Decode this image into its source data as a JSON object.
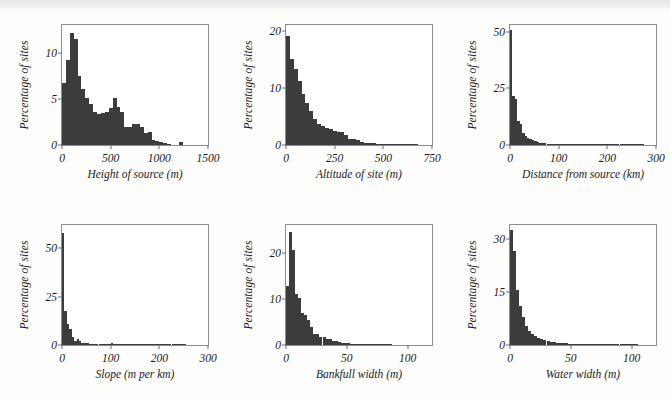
{
  "figure": {
    "background_color": "#fdfdfc",
    "bar_color": "#3c3c3c",
    "axis_color": "#8d8d8d",
    "shared_ylabel": "Percentage of sites"
  },
  "chart_data": [
    {
      "type": "bar",
      "id": "height-of-source",
      "title": "",
      "xlabel": "Height of source (m)",
      "ylabel": "Percentage of sites",
      "xlim": [
        0,
        1500
      ],
      "ylim": [
        0,
        13
      ],
      "xticks": [
        0,
        500,
        1000,
        1500
      ],
      "xtick_labels": [
        "0",
        "500",
        "1000",
        "1500"
      ],
      "yticks": [
        0,
        5,
        10
      ],
      "ytick_labels": [
        "0",
        "5",
        "10"
      ],
      "grid": false,
      "legend": "none",
      "bin_width": 40,
      "bin_starts": [
        0,
        40,
        80,
        120,
        160,
        200,
        240,
        280,
        320,
        360,
        400,
        440,
        480,
        520,
        560,
        600,
        640,
        680,
        720,
        760,
        800,
        840,
        880,
        920,
        960,
        1000,
        1040,
        1080,
        1120,
        1160,
        1200,
        1240
      ],
      "values": [
        6.7,
        9.2,
        12.1,
        11.5,
        7.5,
        6.1,
        5.1,
        4.4,
        3.6,
        3.4,
        3.5,
        3.6,
        4.0,
        5.1,
        4.1,
        3.6,
        2.0,
        2.0,
        2.3,
        2.3,
        1.9,
        1.3,
        1.4,
        0.55,
        0.45,
        0.3,
        0.2,
        0.05,
        0.0,
        0.0,
        0.35,
        0.0
      ]
    },
    {
      "type": "bar",
      "id": "altitude-of-site",
      "title": "",
      "xlabel": "Altitude of site (m)",
      "ylabel": "Percentage of sites",
      "xlim": [
        0,
        750
      ],
      "ylim": [
        0,
        21
      ],
      "xticks": [
        0,
        250,
        500,
        750
      ],
      "xtick_labels": [
        "0",
        "250",
        "500",
        "750"
      ],
      "yticks": [
        0,
        10,
        20
      ],
      "ytick_labels": [
        "0",
        "10",
        "20"
      ],
      "grid": false,
      "legend": "none",
      "bin_width": 20,
      "bin_starts": [
        0,
        20,
        40,
        60,
        80,
        100,
        120,
        140,
        160,
        180,
        200,
        220,
        240,
        260,
        280,
        300,
        320,
        340,
        360,
        380,
        400,
        420,
        440,
        460,
        480,
        500,
        520,
        540,
        560,
        580,
        600,
        620,
        640,
        660,
        680,
        700,
        720
      ],
      "values": [
        19.0,
        15.0,
        13.3,
        11.2,
        9.0,
        7.4,
        6.0,
        4.6,
        3.7,
        3.4,
        2.9,
        2.8,
        2.4,
        2.3,
        2.2,
        1.7,
        1.1,
        1.0,
        0.9,
        0.6,
        0.4,
        0.35,
        0.3,
        0.25,
        0.2,
        0.2,
        0.15,
        0.12,
        0.1,
        0.1,
        0.1,
        0.08,
        0.08,
        0.05,
        0.0,
        0.0,
        0.0
      ]
    },
    {
      "type": "bar",
      "id": "distance-from-source",
      "title": "",
      "xlabel": "Distance from source (km)",
      "ylabel": "Percentage of sites",
      "xlim": [
        0,
        300
      ],
      "ylim": [
        0,
        53
      ],
      "xticks": [
        0,
        100,
        200,
        300
      ],
      "xtick_labels": [
        "0",
        "100",
        "200",
        "300"
      ],
      "yticks": [
        0,
        25,
        50
      ],
      "ytick_labels": [
        "0",
        "25",
        "50"
      ],
      "grid": false,
      "legend": "none",
      "bin_width": 5,
      "bin_starts": [
        0,
        5,
        10,
        15,
        20,
        25,
        30,
        35,
        40,
        45,
        50,
        55,
        60,
        65,
        70,
        75,
        80,
        85,
        90,
        95,
        100,
        105,
        110,
        115,
        120,
        125,
        130,
        135,
        140,
        145,
        150,
        155,
        160,
        165,
        170,
        175,
        180,
        185,
        190,
        195,
        200,
        205,
        210,
        215,
        220,
        225,
        230,
        235,
        240,
        245,
        250,
        255,
        260,
        265,
        270,
        275,
        280,
        285,
        290,
        295
      ],
      "values": [
        51.0,
        21.5,
        20.5,
        10.5,
        9.5,
        5.4,
        4.0,
        3.2,
        2.8,
        2.0,
        1.6,
        1.2,
        1.0,
        0.8,
        0.7,
        0.6,
        0.5,
        0.45,
        0.4,
        0.35,
        0.3,
        0.3,
        0.25,
        0.25,
        0.2,
        0.2,
        0.2,
        0.15,
        0.15,
        0.15,
        0.12,
        0.12,
        0.1,
        0.1,
        0.1,
        0.1,
        0.08,
        0.08,
        0.08,
        0.08,
        0.06,
        0.06,
        0.06,
        0.05,
        0.05,
        0.05,
        0.05,
        0.05,
        0.05,
        0.04,
        0.04,
        0.04,
        0.04,
        0.03,
        0.03,
        0.0,
        0.0,
        0.0,
        0.0,
        0.0
      ]
    },
    {
      "type": "bar",
      "id": "slope",
      "title": "",
      "xlabel": "Slope (m per km)",
      "ylabel": "Percentage of sites",
      "xlim": [
        0,
        300
      ],
      "ylim": [
        0,
        62
      ],
      "xticks": [
        0,
        100,
        200,
        300
      ],
      "xtick_labels": [
        "0",
        "100",
        "200",
        "300"
      ],
      "yticks": [
        0,
        25,
        50
      ],
      "ytick_labels": [
        "0",
        "25",
        "50"
      ],
      "grid": false,
      "legend": "none",
      "bin_width": 5,
      "bin_starts": [
        0,
        5,
        10,
        15,
        20,
        25,
        30,
        35,
        40,
        45,
        50,
        55,
        60,
        65,
        70,
        75,
        80,
        85,
        90,
        95,
        100,
        105,
        110,
        115,
        120,
        125,
        130,
        135,
        140,
        145,
        150,
        155,
        160,
        165,
        170,
        175,
        180,
        185,
        190,
        195,
        200,
        205,
        210,
        215,
        220,
        225,
        230,
        235,
        240,
        245,
        250,
        255,
        260,
        265,
        270,
        275,
        280,
        285,
        290,
        295
      ],
      "values": [
        58.0,
        17.5,
        11.0,
        8.5,
        4.2,
        2.2,
        3.0,
        2.0,
        1.2,
        0.9,
        0.8,
        0.6,
        0.5,
        0.4,
        0.3,
        0.3,
        0.25,
        0.2,
        0.2,
        0.2,
        1.0,
        0.15,
        0.15,
        0.12,
        0.1,
        0.1,
        0.1,
        0.1,
        0.08,
        0.08,
        0.6,
        0.06,
        0.06,
        0.05,
        0.05,
        0.05,
        0.05,
        0.04,
        0.04,
        0.04,
        0.2,
        0.03,
        0.03,
        0.03,
        0.03,
        0.03,
        0.02,
        0.02,
        0.02,
        0.02,
        0.02,
        0.0,
        0.0,
        0.0,
        0.0,
        0.0,
        0.0,
        0.0,
        0.0,
        0.0
      ]
    },
    {
      "type": "bar",
      "id": "bankfull-width",
      "title": "",
      "xlabel": "Bankfull width (m)",
      "ylabel": "Percentage of sites",
      "xlim": [
        0,
        120
      ],
      "ylim": [
        0,
        26
      ],
      "xticks": [
        0,
        50,
        100
      ],
      "xtick_labels": [
        "0",
        "50",
        "100"
      ],
      "yticks": [
        0,
        10,
        20
      ],
      "ytick_labels": [
        "0",
        "10",
        "20"
      ],
      "grid": false,
      "legend": "none",
      "bin_width": 2.5,
      "bin_starts": [
        0,
        2.5,
        5,
        7.5,
        10,
        12.5,
        15,
        17.5,
        20,
        22.5,
        25,
        27.5,
        30,
        32.5,
        35,
        37.5,
        40,
        42.5,
        45,
        47.5,
        50,
        52.5,
        55,
        57.5,
        60,
        62.5,
        65,
        67.5,
        70,
        72.5,
        75,
        77.5,
        80,
        82.5,
        85,
        87.5,
        90,
        92.5,
        95,
        97.5,
        100,
        102.5,
        105,
        107.5,
        110,
        112.5,
        115,
        117.5
      ],
      "values": [
        12.8,
        24.5,
        20.6,
        11.0,
        10.2,
        7.0,
        6.5,
        5.5,
        4.0,
        2.4,
        2.4,
        1.7,
        1.7,
        1.2,
        1.2,
        0.9,
        0.8,
        0.6,
        0.5,
        0.5,
        0.35,
        0.3,
        0.3,
        0.25,
        0.25,
        0.2,
        0.2,
        0.2,
        0.2,
        0.18,
        0.15,
        0.15,
        0.12,
        0.1,
        0.12,
        0.0,
        0.0,
        0.0,
        0.0,
        0.0,
        0.0,
        0.0,
        0.0,
        0.0,
        0.0,
        0.0,
        0.0,
        0.0
      ]
    },
    {
      "type": "bar",
      "id": "water-width",
      "title": "",
      "xlabel": "Water width (m)",
      "ylabel": "Percentage of sites",
      "xlim": [
        0,
        120
      ],
      "ylim": [
        0,
        34
      ],
      "xticks": [
        0,
        50,
        100
      ],
      "xtick_labels": [
        "0",
        "50",
        "100"
      ],
      "yticks": [
        0,
        15,
        30
      ],
      "ytick_labels": [
        "0",
        "15",
        "30"
      ],
      "grid": false,
      "legend": "none",
      "bin_width": 2.5,
      "bin_starts": [
        0,
        2.5,
        5,
        7.5,
        10,
        12.5,
        15,
        17.5,
        20,
        22.5,
        25,
        27.5,
        30,
        32.5,
        35,
        37.5,
        40,
        42.5,
        45,
        47.5,
        50,
        52.5,
        55,
        57.5,
        60,
        62.5,
        65,
        67.5,
        70,
        72.5,
        75,
        77.5,
        80,
        82.5,
        85,
        87.5,
        90,
        92.5,
        95,
        97.5,
        100,
        102.5,
        105,
        107.5,
        110,
        112.5,
        115,
        117.5
      ],
      "values": [
        32.5,
        26.5,
        15.5,
        11.0,
        8.0,
        5.5,
        4.0,
        3.2,
        2.6,
        2.0,
        1.7,
        1.3,
        1.1,
        0.9,
        0.8,
        0.6,
        0.55,
        0.5,
        0.45,
        0.4,
        0.35,
        0.3,
        0.28,
        0.25,
        0.25,
        0.2,
        0.2,
        0.2,
        0.18,
        0.18,
        0.15,
        0.15,
        0.12,
        0.1,
        0.1,
        0.1,
        0.08,
        0.08,
        0.06,
        0.06,
        0.3,
        0.05,
        0.0,
        0.0,
        0.0,
        0.0,
        0.0,
        0.0
      ]
    }
  ]
}
